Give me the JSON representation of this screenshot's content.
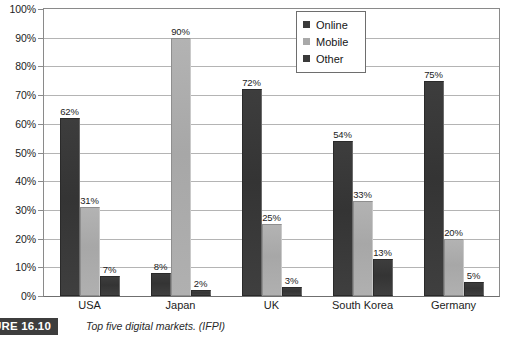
{
  "chart_data": {
    "type": "bar",
    "title": "",
    "xlabel": "",
    "ylabel": "",
    "ylim": [
      0,
      100
    ],
    "grid": true,
    "legend_position": "top-center-right",
    "categories": [
      "USA",
      "Japan",
      "UK",
      "South Korea",
      "Germany"
    ],
    "series": [
      {
        "name": "Online",
        "color": "#3a3a3a",
        "values": [
          62,
          8,
          72,
          54,
          75
        ]
      },
      {
        "name": "Mobile",
        "color": "#a9a9a9",
        "values": [
          31,
          90,
          25,
          33,
          20
        ]
      },
      {
        "name": "Other",
        "color": "#3a3a3a",
        "values": [
          7,
          2,
          3,
          13,
          5
        ]
      }
    ],
    "value_labels": [
      [
        "62%",
        "31%",
        "7%"
      ],
      [
        "8%",
        "90%",
        "2%"
      ],
      [
        "72%",
        "25%",
        "3%"
      ],
      [
        "54%",
        "33%",
        "13%"
      ],
      [
        "75%",
        "20%",
        "5%"
      ]
    ],
    "y_ticks": [
      {
        "value": 100,
        "label": "100%"
      },
      {
        "value": 90,
        "label": "90%"
      },
      {
        "value": 80,
        "label": "80%"
      },
      {
        "value": 70,
        "label": "70%"
      },
      {
        "value": 60,
        "label": "60%"
      },
      {
        "value": 50,
        "label": "50%"
      },
      {
        "value": 40,
        "label": "40%"
      },
      {
        "value": 30,
        "label": "30%"
      },
      {
        "value": 20,
        "label": "20%"
      },
      {
        "value": 10,
        "label": "10%"
      },
      {
        "value": 0,
        "label": "0%"
      }
    ]
  },
  "legend": {
    "items": [
      {
        "label": "Online",
        "swatch": "sw-online"
      },
      {
        "label": "Mobile",
        "swatch": "sw-mobile"
      },
      {
        "label": "Other",
        "swatch": "sw-other"
      }
    ]
  },
  "caption": {
    "badge": "URE 16.10",
    "text": "Top five digital markets. (IFPI)"
  }
}
